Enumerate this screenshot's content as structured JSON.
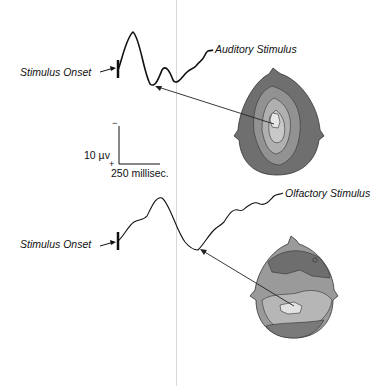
{
  "figure": {
    "top_cutoff_text": "",
    "panels": [
      {
        "id": "auditory",
        "stimulus_label": "Auditory Stimulus",
        "onset_label": "Stimulus Onset",
        "map_description": "scalp topography, peak central-posterior"
      },
      {
        "id": "olfactory",
        "stimulus_label": "Olfactory Stimulus",
        "onset_label": "Stimulus Onset",
        "map_description": "scalp topography, peak posterior"
      }
    ],
    "scale_bar": {
      "amplitude_label": "10 µv",
      "time_label": "250 millisec.",
      "minus": "−",
      "plus": "+"
    },
    "colors": {
      "map_dark": "#6b6b6b",
      "map_mid": "#8f8f8f",
      "map_light": "#b4b4b4",
      "map_lightest": "#dcdcdc",
      "line": "#111111"
    }
  }
}
